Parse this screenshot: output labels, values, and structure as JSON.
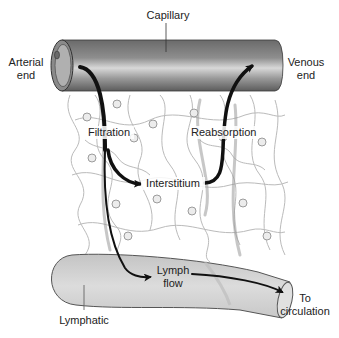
{
  "diagram": {
    "labels": {
      "capillary": "Capillary",
      "arterial_end_line1": "Arterial",
      "arterial_end_line2": "end",
      "venous_end_line1": "Venous",
      "venous_end_line2": "end",
      "filtration": "Filtration",
      "reabsorption": "Reabsorption",
      "interstitium": "Interstitium",
      "lymph_flow_line1": "Lymph",
      "lymph_flow_line2": "flow",
      "lymphatic": "Lymphatic",
      "to_circulation_line1": "To",
      "to_circulation_line2": "circulation"
    },
    "colors": {
      "capillary_dark": "#5a5a5a",
      "capillary_light": "#c8c8c8",
      "lymphatic_fill": "#d4d4d4",
      "tissue_fibers": "#b0b0b0",
      "arrow": "#111111",
      "text": "#222222"
    }
  }
}
